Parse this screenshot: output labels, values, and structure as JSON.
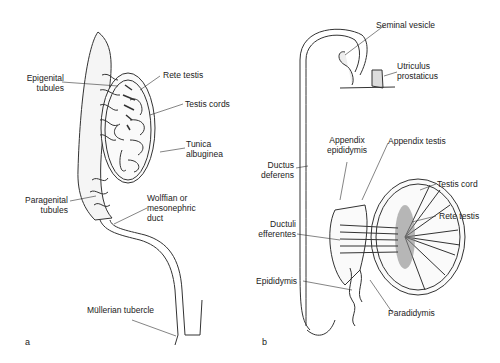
{
  "figure": {
    "panels": [
      {
        "id": "a",
        "letter": "a",
        "labels": {
          "epigenital_1": "Epigenital",
          "epigenital_2": "tubules",
          "rete_testis": "Rete testis",
          "testis_cords": "Testis cords",
          "tunica_1": "Tunica",
          "tunica_2": "albuginea",
          "paragenital_1": "Paragenital",
          "paragenital_2": "tubules",
          "wolffian_1": "Wolffian or",
          "wolffian_2": "mesonephric",
          "wolffian_3": "duct",
          "mullerian": "Müllerian tubercle"
        }
      },
      {
        "id": "b",
        "letter": "b",
        "labels": {
          "seminal_vesicle": "Seminal vesicle",
          "utriculus_1": "Utriculus",
          "utriculus_2": "prostaticus",
          "app_epid_1": "Appendix",
          "app_epid_2": "epididymis",
          "appendix_testis": "Appendix testis",
          "ductus_1": "Ductus",
          "ductus_2": "deferens",
          "testis_cord": "Testis cord",
          "rete_testis": "Rete testis",
          "ductuli_1": "Ductuli",
          "ductuli_2": "efferentes",
          "epididymis": "Epididymis",
          "paradidymis": "Paradidymis"
        }
      }
    ]
  }
}
